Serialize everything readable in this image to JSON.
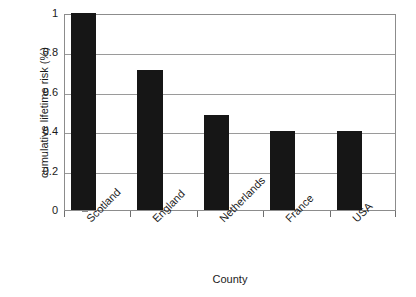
{
  "chart_data": {
    "type": "bar",
    "title": "",
    "subtitle": "",
    "categories": [
      "Scotland",
      "England",
      "Netherlands",
      "France",
      "USA"
    ],
    "values": [
      1.0,
      0.71,
      0.48,
      0.4,
      0.4
    ],
    "series": [
      {
        "name": "cumulative lifetime risk",
        "values": [
          1.0,
          0.71,
          0.48,
          0.4,
          0.4
        ]
      }
    ],
    "xlabel": "County",
    "ylabel": "cumulative lifetime risk (%)",
    "ylim": [
      0,
      1
    ],
    "xlim": null,
    "ytick_labels": [
      "1",
      "0.8",
      "0.6",
      "0.4",
      "0.2",
      "0"
    ],
    "ytick_values": [
      1,
      0.8,
      0.6,
      0.4,
      0.2,
      0
    ],
    "grid": true,
    "grid_axis": "y",
    "legend": false,
    "legend_position": "none",
    "annotations": [],
    "bar_color": "#161616",
    "grid_color": "#9a9a9a",
    "frame_color": "#8c8c8c",
    "background_color": "#ffffff",
    "xtick_label_rotation": -45
  }
}
